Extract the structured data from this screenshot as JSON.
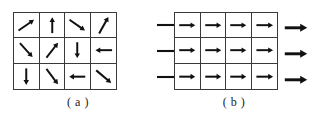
{
  "figure": {
    "type": "vector-field-diagram",
    "panels": [
      {
        "id": "a",
        "caption": "( a )",
        "grid": {
          "rows": 3,
          "cols": 4
        },
        "description": "Randomly oriented unit arrows in a 4x3 grid",
        "arrows": [
          {
            "row": 0,
            "col": 0,
            "direction": "north-east",
            "angle_deg": 35
          },
          {
            "row": 0,
            "col": 1,
            "direction": "north",
            "angle_deg": 90
          },
          {
            "row": 0,
            "col": 2,
            "direction": "south-east",
            "angle_deg": -35
          },
          {
            "row": 0,
            "col": 3,
            "direction": "north-east",
            "angle_deg": 62
          },
          {
            "row": 1,
            "col": 0,
            "direction": "south-east",
            "angle_deg": -48
          },
          {
            "row": 1,
            "col": 1,
            "direction": "north-east",
            "angle_deg": 52
          },
          {
            "row": 1,
            "col": 2,
            "direction": "south",
            "angle_deg": -90
          },
          {
            "row": 1,
            "col": 3,
            "direction": "west",
            "angle_deg": 180
          },
          {
            "row": 2,
            "col": 0,
            "direction": "south",
            "angle_deg": -90
          },
          {
            "row": 2,
            "col": 1,
            "direction": "south-east",
            "angle_deg": -52
          },
          {
            "row": 2,
            "col": 2,
            "direction": "west",
            "angle_deg": 180
          },
          {
            "row": 2,
            "col": 3,
            "direction": "south-east",
            "angle_deg": -40
          }
        ],
        "external_arrows": []
      },
      {
        "id": "b",
        "caption": "( b )",
        "grid": {
          "rows": 3,
          "cols": 4
        },
        "description": "All arrows aligned pointing east, with inflow lines at left and outflow arrows at right",
        "arrows": [
          {
            "row": 0,
            "col": 0,
            "direction": "east",
            "angle_deg": 0
          },
          {
            "row": 0,
            "col": 1,
            "direction": "east",
            "angle_deg": 0
          },
          {
            "row": 0,
            "col": 2,
            "direction": "east",
            "angle_deg": 0
          },
          {
            "row": 0,
            "col": 3,
            "direction": "east",
            "angle_deg": 0
          },
          {
            "row": 1,
            "col": 0,
            "direction": "east",
            "angle_deg": 0
          },
          {
            "row": 1,
            "col": 1,
            "direction": "east",
            "angle_deg": 0
          },
          {
            "row": 1,
            "col": 2,
            "direction": "east",
            "angle_deg": 0
          },
          {
            "row": 1,
            "col": 3,
            "direction": "east",
            "angle_deg": 0
          },
          {
            "row": 2,
            "col": 0,
            "direction": "east",
            "angle_deg": 0
          },
          {
            "row": 2,
            "col": 1,
            "direction": "east",
            "angle_deg": 0
          },
          {
            "row": 2,
            "col": 2,
            "direction": "east",
            "angle_deg": 0
          },
          {
            "row": 2,
            "col": 3,
            "direction": "east",
            "angle_deg": 0
          }
        ],
        "external_arrows": [
          {
            "side": "left",
            "row": 0,
            "style": "line-no-head"
          },
          {
            "side": "left",
            "row": 1,
            "style": "line-no-head"
          },
          {
            "side": "left",
            "row": 2,
            "style": "line-no-head"
          },
          {
            "side": "right",
            "row": 0,
            "style": "arrow-east"
          },
          {
            "side": "right",
            "row": 1,
            "style": "arrow-east"
          },
          {
            "side": "right",
            "row": 2,
            "style": "arrow-east"
          }
        ]
      }
    ],
    "colors": {
      "stroke": "#111111",
      "grid_border": "#3a3a3a",
      "background": "#ffffff",
      "caption": "#222222"
    }
  }
}
